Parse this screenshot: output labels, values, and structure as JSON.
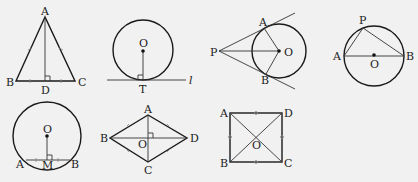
{
  "figures": [
    {
      "id": "isosceles-triangle",
      "labels": {
        "A": "A",
        "B": "B",
        "C": "C",
        "D": "D"
      }
    },
    {
      "id": "tangent-line",
      "labels": {
        "O": "O",
        "T": "T",
        "l": "l"
      }
    },
    {
      "id": "two-tangents",
      "labels": {
        "P": "P",
        "A": "A",
        "B": "B",
        "O": "O"
      }
    },
    {
      "id": "inscribed-right-angle",
      "labels": {
        "P": "P",
        "A": "A",
        "B": "B",
        "O": "O"
      }
    },
    {
      "id": "chord-midpoint",
      "labels": {
        "O": "O",
        "A": "A",
        "M": "M",
        "B": "B"
      }
    },
    {
      "id": "rhombus",
      "labels": {
        "A": "A",
        "B": "B",
        "C": "C",
        "D": "D",
        "O": "O"
      }
    },
    {
      "id": "square",
      "labels": {
        "A": "A",
        "B": "B",
        "C": "C",
        "D": "D",
        "O": "O"
      }
    }
  ],
  "colors": {
    "background": "#f1f1f1",
    "ink": "#1a1a1a"
  }
}
